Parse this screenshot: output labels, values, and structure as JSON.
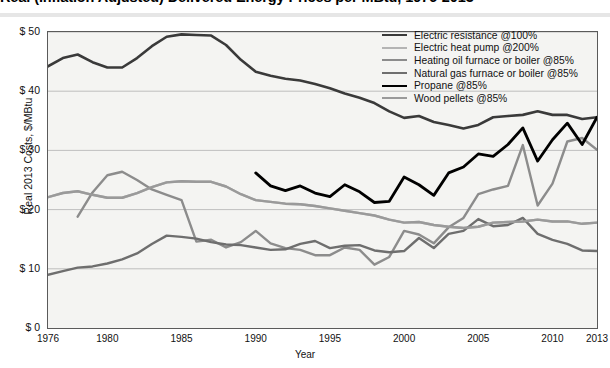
{
  "title": "Real (Inflation Adjusted) Delivered Energy Prices per MBtu, 1976-2013",
  "axes": {
    "ylabel": "Real 2013 Costs, $/MBtu",
    "xlabel": "Year",
    "yticks": [
      "$ 50",
      "$ 40",
      "$ 30",
      "$ 20",
      "$ 10",
      "$ 0"
    ],
    "xticks": [
      "1976",
      "1980",
      "1985",
      "1990",
      "1995",
      "2000",
      "2005",
      "2010",
      "2013"
    ]
  },
  "legend": [
    {
      "label": "Electric resistance @100%",
      "color": "#3a3a3a",
      "width": 2.6
    },
    {
      "label": "Electric heat pump @200%",
      "color": "#b4b4b4",
      "width": 2.4
    },
    {
      "label": "Heating oil furnace or boiler @85%",
      "color": "#8c8c8c",
      "width": 2.4
    },
    {
      "label": "Natural gas furnace or boiler @85%",
      "color": "#6e6e6e",
      "width": 2.4
    },
    {
      "label": "Propane @85%",
      "color": "#000000",
      "width": 2.8
    },
    {
      "label": "Wood pellets @85%",
      "color": "#9a9a9a",
      "width": 2.4
    }
  ],
  "chart_data": {
    "type": "line",
    "title": "Real (Inflation Adjusted) Delivered Energy Prices per MBtu, 1976-2013",
    "xlabel": "Year",
    "ylabel": "Real 2013 Costs, $/MBtu",
    "xlim": [
      1976,
      2013
    ],
    "ylim": [
      0,
      50
    ],
    "ytick_values": [
      0,
      10,
      20,
      30,
      40,
      50
    ],
    "xtick_values": [
      1976,
      1980,
      1985,
      1990,
      1995,
      2000,
      2005,
      2010,
      2013
    ],
    "grid": "horizontal",
    "legend_position": "top-right",
    "series": [
      {
        "name": "Electric resistance @100%",
        "color": "#3a3a3a",
        "x": [
          1976,
          1977,
          1978,
          1979,
          1980,
          1981,
          1982,
          1983,
          1984,
          1985,
          1986,
          1987,
          1988,
          1989,
          1990,
          1991,
          1992,
          1993,
          1994,
          1995,
          1996,
          1997,
          1998,
          1999,
          2000,
          2001,
          2002,
          2003,
          2004,
          2005,
          2006,
          2007,
          2008,
          2009,
          2010,
          2011,
          2012,
          2013
        ],
        "y": [
          44.2,
          45.6,
          46.2,
          44.9,
          44.0,
          44.0,
          45.6,
          47.6,
          49.2,
          49.6,
          49.5,
          49.4,
          47.8,
          45.3,
          43.3,
          42.6,
          42.1,
          41.8,
          41.2,
          40.5,
          39.6,
          38.9,
          38.0,
          36.6,
          35.5,
          35.8,
          34.8,
          34.3,
          33.7,
          34.3,
          35.6,
          35.8,
          36.0,
          36.6,
          36.0,
          36.0,
          35.3,
          35.6
        ]
      },
      {
        "name": "Electric heat pump @200%",
        "color": "#b4b4b4",
        "x": [
          1976,
          1977,
          1978,
          1979,
          1980,
          1981,
          1982,
          1983,
          1984,
          1985,
          1986,
          1987,
          1988,
          1989,
          1990,
          1991,
          1992,
          1993,
          1994,
          1995,
          1996,
          1997,
          1998,
          1999,
          2000,
          2001,
          2002,
          2003,
          2004,
          2005,
          2006,
          2007,
          2008,
          2009,
          2010,
          2011,
          2012,
          2013
        ],
        "y": [
          22.1,
          22.8,
          23.1,
          22.5,
          22.0,
          22.0,
          22.8,
          23.8,
          24.6,
          24.8,
          24.7,
          24.7,
          23.9,
          22.6,
          21.6,
          21.3,
          21.0,
          20.9,
          20.6,
          20.2,
          19.8,
          19.4,
          19.0,
          18.3,
          17.8,
          17.9,
          17.4,
          17.1,
          16.9,
          17.1,
          17.8,
          17.9,
          18.0,
          18.3,
          18.0,
          18.0,
          17.6,
          17.8
        ]
      },
      {
        "name": "Heating oil furnace or boiler @85%",
        "color": "#8c8c8c",
        "x": [
          1978,
          1979,
          1980,
          1981,
          1982,
          1983,
          1984,
          1985,
          1986,
          1987,
          1988,
          1989,
          1990,
          1991,
          1992,
          1993,
          1994,
          1995,
          1996,
          1997,
          1998,
          1999,
          2000,
          2001,
          2002,
          2003,
          2004,
          2005,
          2006,
          2007,
          2008,
          2009,
          2010,
          2011,
          2012,
          2013
        ],
        "y": [
          18.8,
          22.9,
          25.8,
          26.4,
          25.0,
          23.4,
          22.5,
          21.6,
          14.6,
          14.9,
          13.6,
          14.5,
          16.4,
          14.3,
          13.5,
          13.2,
          12.3,
          12.3,
          13.6,
          13.2,
          10.7,
          12.0,
          16.4,
          15.8,
          14.3,
          17.0,
          18.6,
          22.6,
          23.4,
          24.0,
          30.9,
          20.7,
          24.4,
          31.5,
          32.1,
          30.1
        ]
      },
      {
        "name": "Natural gas furnace or boiler @85%",
        "color": "#6e6e6e",
        "x": [
          1976,
          1977,
          1978,
          1979,
          1980,
          1981,
          1982,
          1983,
          1984,
          1985,
          1986,
          1987,
          1988,
          1989,
          1990,
          1991,
          1992,
          1993,
          1994,
          1995,
          1996,
          1997,
          1998,
          1999,
          2000,
          2001,
          2002,
          2003,
          2004,
          2005,
          2006,
          2007,
          2008,
          2009,
          2010,
          2011,
          2012,
          2013
        ],
        "y": [
          9.0,
          9.6,
          10.2,
          10.4,
          10.9,
          11.6,
          12.6,
          14.2,
          15.6,
          15.4,
          15.1,
          14.5,
          14.1,
          14.0,
          13.6,
          13.2,
          13.3,
          14.2,
          14.7,
          13.5,
          13.9,
          14.0,
          13.1,
          12.8,
          13.0,
          15.2,
          13.5,
          15.9,
          16.4,
          18.4,
          17.2,
          17.4,
          18.6,
          15.9,
          14.9,
          14.2,
          13.1,
          13.0
        ]
      },
      {
        "name": "Propane @85%",
        "color": "#000000",
        "x": [
          1990,
          1991,
          1992,
          1993,
          1994,
          1995,
          1996,
          1997,
          1998,
          1999,
          2000,
          2001,
          2002,
          2003,
          2004,
          2005,
          2006,
          2007,
          2008,
          2009,
          2010,
          2011,
          2012,
          2013
        ],
        "y": [
          26.2,
          24.0,
          23.2,
          24.0,
          22.8,
          22.2,
          24.2,
          23.0,
          21.2,
          21.4,
          25.5,
          24.2,
          22.4,
          26.2,
          27.2,
          29.4,
          29.0,
          31.0,
          33.8,
          28.2,
          31.8,
          34.6,
          31.0,
          35.6
        ]
      },
      {
        "name": "Wood pellets @85%",
        "color": "#9a9a9a",
        "x": [
          1976,
          1977,
          1978,
          1979,
          1980,
          1981,
          1982,
          1983,
          1984,
          1985,
          1986,
          1987,
          1988,
          1989,
          1990,
          1991,
          1992,
          1993,
          1994,
          1995,
          1996,
          1997,
          1998,
          1999,
          2000,
          2001,
          2002,
          2003,
          2004,
          2005,
          2006,
          2007,
          2008,
          2009,
          2010,
          2011,
          2012,
          2013
        ],
        "y": [
          22.1,
          22.8,
          23.1,
          22.5,
          22.0,
          22.0,
          22.8,
          23.8,
          24.6,
          24.8,
          24.7,
          24.7,
          23.9,
          22.6,
          21.6,
          21.3,
          21.0,
          20.9,
          20.6,
          20.2,
          19.8,
          19.4,
          19.0,
          18.3,
          17.8,
          17.9,
          17.4,
          17.1,
          16.9,
          17.1,
          17.8,
          17.9,
          18.0,
          18.3,
          18.0,
          18.0,
          17.6,
          17.8
        ]
      }
    ]
  }
}
